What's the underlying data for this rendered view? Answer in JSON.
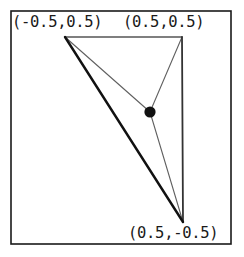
{
  "figure": {
    "title": "",
    "width": 244,
    "height": 257,
    "background_color": "#ffffff"
  },
  "frame": {
    "name": "plot-border",
    "x": 11,
    "y": 11,
    "width": 220,
    "height": 233,
    "stroke_color": "#1a1a1a",
    "stroke_width": 1.6
  },
  "labels": {
    "top_left": "(-0.5,0.5)",
    "top_right": "(0.5,0.5)",
    "bottom_right": "(0.5,-0.5)"
  },
  "chart_data": {
    "type": "scatter",
    "title": "",
    "xlabel": "",
    "ylabel": "",
    "xlim": [
      -0.5,
      0.5
    ],
    "ylim": [
      -0.5,
      0.5
    ],
    "grid": false,
    "legend": "none",
    "annotations": [
      {
        "text": "(-0.5,0.5)",
        "x": -0.5,
        "y": 0.5
      },
      {
        "text": "(0.5,0.5)",
        "x": 0.5,
        "y": 0.5
      },
      {
        "text": "(0.5,-0.5)",
        "x": 0.5,
        "y": -0.5
      }
    ],
    "vertices": [
      {
        "name": "top-left-vertex",
        "label": "(-0.5,0.5)",
        "x": -0.5,
        "y": 0.5,
        "px": 65,
        "py": 37
      },
      {
        "name": "top-right-vertex",
        "label": "(0.5,0.5)",
        "x": 0.5,
        "y": 0.5,
        "px": 182,
        "py": 37
      },
      {
        "name": "bottom-right-vertex",
        "label": "(0.5,-0.5)",
        "x": 0.5,
        "y": -0.5,
        "px": 183,
        "py": 222
      }
    ],
    "centroid": {
      "name": "centroid-point",
      "x": 0.1667,
      "y": 0.1667,
      "px": 150,
      "py": 112,
      "radius": 5.6,
      "color": "#111111"
    },
    "edges": [
      {
        "name": "triangle-edge-top",
        "from": 0,
        "to": 1,
        "stroke_width": 1.3,
        "color": "#555555"
      },
      {
        "name": "triangle-edge-right",
        "from": 1,
        "to": 2,
        "stroke_width": 1.8,
        "color": "#333333"
      },
      {
        "name": "triangle-edge-hypotenuse",
        "from": 2,
        "to": 0,
        "stroke_width": 2.4,
        "color": "#111111"
      }
    ],
    "medians": [
      {
        "name": "median-to-top-left",
        "from_vertex": 0,
        "stroke_width": 1.1,
        "color": "#606060"
      },
      {
        "name": "median-to-top-right",
        "from_vertex": 1,
        "stroke_width": 1.1,
        "color": "#606060"
      },
      {
        "name": "median-to-bottom-right",
        "from_vertex": 2,
        "stroke_width": 1.1,
        "color": "#606060"
      }
    ]
  }
}
